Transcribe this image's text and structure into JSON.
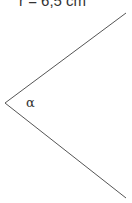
{
  "diagram": {
    "radius_label": "r = 6,5 cm",
    "angle_label": "α",
    "line_color": "#555555",
    "text_color": "#333333"
  }
}
